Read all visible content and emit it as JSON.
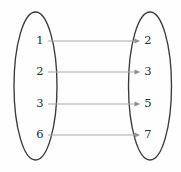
{
  "figure": {
    "background_color": "#fefefe",
    "width": 181,
    "height": 172
  },
  "style": {
    "ellipse_stroke": "#3a3a3a",
    "line_color": "#a8a8a8",
    "arrow_color": "#8f8f8f",
    "label_color": "#2b2b2b"
  },
  "domain_set": {
    "name": "domain-set",
    "center_x": 35.5,
    "center_y": 86,
    "radius_x": 21.5,
    "radius_y": 74,
    "elements": [
      {
        "label": "1",
        "x": 40,
        "y": 41
      },
      {
        "label": "2",
        "x": 40,
        "y": 72
      },
      {
        "label": "3",
        "x": 40,
        "y": 104
      },
      {
        "label": "6",
        "x": 40,
        "y": 135
      }
    ]
  },
  "codomain_set": {
    "name": "codomain-set",
    "center_x": 150,
    "center_y": 86,
    "radius_x": 21.5,
    "radius_y": 74,
    "elements": [
      {
        "label": "2",
        "x": 148,
        "y": 41
      },
      {
        "label": "3",
        "x": 148,
        "y": 72
      },
      {
        "label": "5",
        "x": 148,
        "y": 104
      },
      {
        "label": "7",
        "x": 148,
        "y": 135
      }
    ]
  },
  "mappings": [
    {
      "from": "1",
      "to": "2",
      "x1": 48,
      "x2": 140,
      "y": 41
    },
    {
      "from": "2",
      "to": "3",
      "x1": 48,
      "x2": 140,
      "y": 72
    },
    {
      "from": "3",
      "to": "5",
      "x1": 48,
      "x2": 140,
      "y": 104
    },
    {
      "from": "6",
      "to": "7",
      "x1": 48,
      "x2": 140,
      "y": 135
    }
  ]
}
